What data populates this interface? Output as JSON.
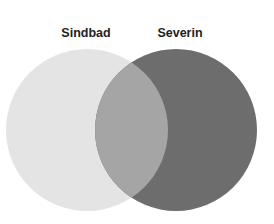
{
  "diagram": {
    "type": "venn",
    "sets": [
      {
        "name": "Sindbad",
        "color": "#e4e4e4"
      },
      {
        "name": "Severin",
        "color": "#6d6d6d"
      }
    ],
    "intersection": {
      "color": "#a5a5a5"
    }
  }
}
